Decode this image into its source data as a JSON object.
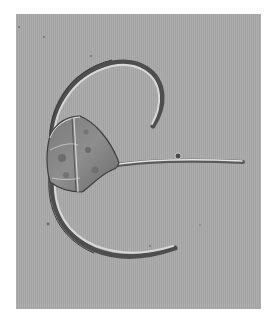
{
  "image": {
    "description": "Differential interference contrast micrograph of a Ceratium dinoflagellate with two long curved antapical horns and a straight apical horn",
    "subject": "dinoflagellate",
    "colors": {
      "border": "#ffffff",
      "background": "#a9a9a9",
      "cell_dark": "#5a5a5a",
      "highlight": "#e6e6e6"
    }
  }
}
